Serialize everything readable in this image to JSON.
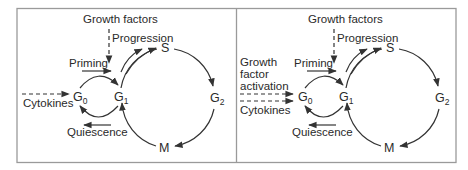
{
  "figure": {
    "panels": [
      {
        "id": "left",
        "top_label": "Growth factors",
        "progression_label": "Progression",
        "priming_label": "Priming",
        "quiescence_label": "Quiescence",
        "inputs": [
          "Cytokines"
        ],
        "phases": {
          "g0": "G",
          "g0_sub": "0",
          "g1": "G",
          "g1_sub": "1",
          "s": "S",
          "g2": "G",
          "g2_sub": "2",
          "m": "M"
        }
      },
      {
        "id": "right",
        "top_label": "Growth factors",
        "progression_label": "Progression",
        "priming_label": "Priming",
        "quiescence_label": "Quiescence",
        "inputs_growth_factor_activation": [
          "Growth",
          "factor",
          "activation"
        ],
        "inputs": [
          "Cytokines"
        ],
        "phases": {
          "g0": "G",
          "g0_sub": "0",
          "g1": "G",
          "g1_sub": "1",
          "s": "S",
          "g2": "G",
          "g2_sub": "2",
          "m": "M"
        }
      }
    ]
  }
}
